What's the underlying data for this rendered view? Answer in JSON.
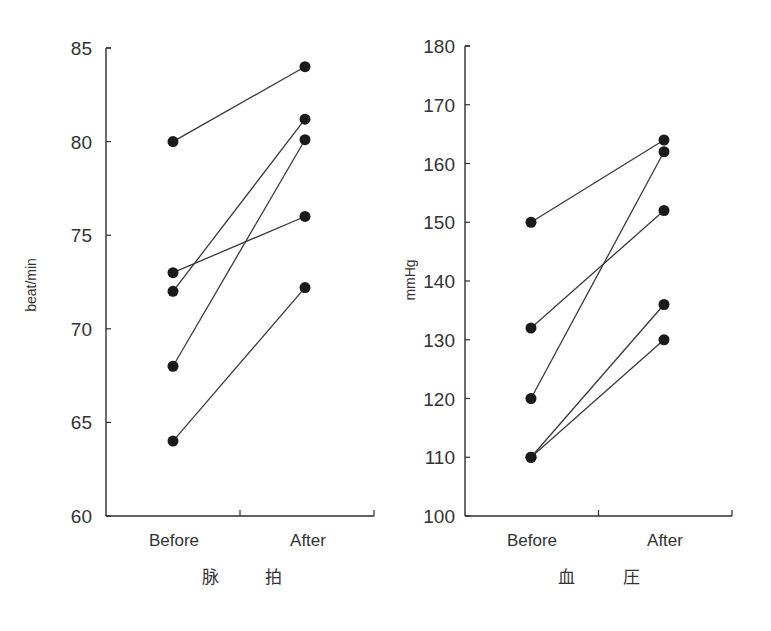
{
  "chart_data": [
    {
      "type": "line",
      "title": "脉 拍",
      "xlabel": "脉 拍",
      "ylabel": "beat/min",
      "categories": [
        "Before",
        "After"
      ],
      "ylim": [
        60,
        85
      ],
      "yticks": [
        60,
        65,
        70,
        75,
        80,
        85
      ],
      "grid": false,
      "legend": "none",
      "marker": "filled-circle",
      "series": [
        {
          "name": "subject-1",
          "values": [
            80,
            84
          ]
        },
        {
          "name": "subject-2",
          "values": [
            73,
            76
          ]
        },
        {
          "name": "subject-3",
          "values": [
            72,
            81.2
          ]
        },
        {
          "name": "subject-4",
          "values": [
            68,
            80.1
          ]
        },
        {
          "name": "subject-5",
          "values": [
            64,
            72.2
          ]
        }
      ]
    },
    {
      "type": "line",
      "title": "血 圧",
      "xlabel": "血 圧",
      "ylabel": "mmHg",
      "categories": [
        "Before",
        "After"
      ],
      "ylim": [
        100,
        180
      ],
      "yticks": [
        100,
        110,
        120,
        130,
        140,
        150,
        160,
        170,
        180
      ],
      "grid": false,
      "legend": "none",
      "marker": "filled-circle",
      "series": [
        {
          "name": "subject-1",
          "values": [
            150,
            164
          ]
        },
        {
          "name": "subject-2",
          "values": [
            132,
            152
          ]
        },
        {
          "name": "subject-3",
          "values": [
            120,
            162
          ]
        },
        {
          "name": "subject-4",
          "values": [
            110,
            136
          ]
        },
        {
          "name": "subject-5",
          "values": [
            110,
            130
          ]
        }
      ]
    }
  ],
  "panels": {
    "pulse": {
      "ylabel": "beat/min",
      "title_left": "脉",
      "title_right": "拍",
      "before_label": "Before",
      "after_label": "After"
    },
    "bp": {
      "ylabel": "mmHg",
      "title_left": "血",
      "title_right": "圧",
      "before_label": "Before",
      "after_label": "After"
    }
  },
  "style": {
    "line_color": "#3a3a3a",
    "marker_color": "#1a1a1a",
    "axis_color": "#2e2e2e"
  }
}
